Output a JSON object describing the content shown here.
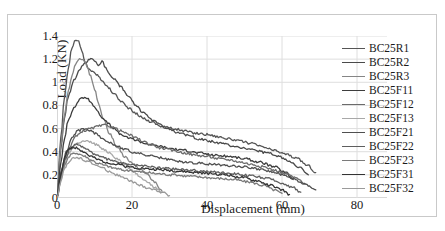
{
  "chart_data": {
    "type": "line",
    "title": "",
    "xlabel": "Displacement (mm)",
    "ylabel": "Load (KN)",
    "xlim": [
      0,
      88
    ],
    "ylim": [
      0,
      1.4
    ],
    "xticks": [
      0,
      20,
      40,
      60,
      80
    ],
    "yticks": [
      "0",
      "0.2",
      "0.4",
      "0.6",
      "0.8",
      "1",
      "1.2",
      "1.4"
    ],
    "grid": "both",
    "legend_position": "right",
    "series": [
      {
        "name": "BC25R1",
        "color": "#555555",
        "x": [
          0,
          1.0,
          2.0,
          3.0,
          4.0,
          5.0,
          5.8,
          6.6,
          7.5,
          8.5,
          9.5,
          10.5,
          12.0,
          13.5,
          15.0,
          17.0,
          19.0,
          21.0,
          23.0,
          25.0,
          28.0,
          31.0,
          34.0,
          37.0,
          40.0,
          43.0,
          46.0,
          49.0,
          52.0,
          55.0,
          58.0,
          61.0,
          64.0,
          67.0,
          69.0
        ],
        "y": [
          0,
          0.52,
          0.88,
          1.12,
          1.3,
          1.37,
          1.35,
          1.27,
          1.17,
          1.12,
          1.09,
          1.07,
          1.02,
          0.96,
          0.91,
          0.84,
          0.78,
          0.73,
          0.69,
          0.66,
          0.62,
          0.6,
          0.58,
          0.56,
          0.55,
          0.53,
          0.51,
          0.49,
          0.47,
          0.44,
          0.41,
          0.38,
          0.34,
          0.28,
          0.22
        ]
      },
      {
        "name": "BC25R2",
        "color": "#4a4a4a",
        "x": [
          0,
          1.0,
          2.0,
          3.0,
          4.5,
          6.0,
          7.5,
          9.0,
          10.0,
          11.0,
          12.0,
          13.0,
          14.0,
          15.5,
          17.0,
          19.0,
          21.0,
          23.0,
          26.0,
          29.0,
          32.0,
          35.0,
          38.0,
          41.0,
          44.0,
          47.0,
          50.0,
          53.0,
          56.0,
          59.0,
          62.0,
          65.0,
          67.0
        ],
        "y": [
          0,
          0.42,
          0.7,
          0.88,
          1.02,
          1.11,
          1.17,
          1.21,
          1.19,
          1.15,
          1.18,
          1.13,
          1.07,
          1.02,
          0.96,
          0.88,
          0.8,
          0.74,
          0.66,
          0.61,
          0.57,
          0.54,
          0.51,
          0.49,
          0.47,
          0.45,
          0.43,
          0.41,
          0.39,
          0.36,
          0.32,
          0.26,
          0.2
        ]
      },
      {
        "name": "BC25R3",
        "color": "#858585",
        "x": [
          0,
          1.0,
          2.0,
          3.0,
          4.0,
          5.0,
          6.0,
          7.0,
          8.0,
          9.0,
          10.0,
          11.0,
          12.5,
          14.0,
          16.0,
          18.0,
          20.0,
          22.0,
          24.0,
          26.0,
          28.0
        ],
        "y": [
          0,
          0.45,
          0.72,
          0.92,
          1.06,
          1.16,
          1.21,
          1.2,
          1.14,
          1.05,
          0.94,
          0.82,
          0.68,
          0.56,
          0.44,
          0.36,
          0.3,
          0.25,
          0.2,
          0.14,
          0.06
        ]
      },
      {
        "name": "BC25F11",
        "color": "#3d3d3d",
        "x": [
          0,
          1.0,
          2.0,
          3.0,
          4.5,
          6.0,
          7.0,
          8.0,
          9.0,
          10.0,
          11.0,
          12.0,
          13.5,
          15.0,
          17.0,
          19.0,
          21.0,
          24.0,
          27.0,
          30.0,
          34.0,
          38.0,
          42.0,
          46.0,
          50.0,
          54.0,
          58.0,
          61.0,
          63.0
        ],
        "y": [
          0,
          0.3,
          0.52,
          0.67,
          0.78,
          0.85,
          0.87,
          0.86,
          0.83,
          0.79,
          0.74,
          0.7,
          0.65,
          0.6,
          0.55,
          0.52,
          0.5,
          0.47,
          0.45,
          0.43,
          0.41,
          0.39,
          0.37,
          0.36,
          0.34,
          0.31,
          0.27,
          0.22,
          0.16
        ]
      },
      {
        "name": "BC25F12",
        "color": "#6b6b6b",
        "x": [
          0,
          1.5,
          3.0,
          5.0,
          7.0,
          9.0,
          11.0,
          13.0,
          15.0,
          17.0,
          19.0,
          21.0,
          23.0,
          25.0,
          28.0,
          31.0,
          34.0,
          37.0,
          40.0,
          43.0,
          46.0,
          49.0,
          52.0,
          55.0,
          58.0,
          61.0,
          64.0,
          66.0
        ],
        "y": [
          0,
          0.26,
          0.42,
          0.53,
          0.58,
          0.6,
          0.62,
          0.63,
          0.61,
          0.58,
          0.55,
          0.52,
          0.49,
          0.46,
          0.43,
          0.41,
          0.39,
          0.37,
          0.36,
          0.34,
          0.33,
          0.31,
          0.29,
          0.27,
          0.24,
          0.21,
          0.17,
          0.12
        ]
      },
      {
        "name": "BC25F13",
        "color": "#a8a8a8",
        "x": [
          0,
          1.5,
          3.0,
          4.5,
          6.0,
          7.5,
          9.0,
          10.5,
          12.0,
          14.0,
          16.0,
          18.0,
          20.0,
          22.0,
          24.0,
          26.0,
          28.0
        ],
        "y": [
          0,
          0.24,
          0.38,
          0.45,
          0.48,
          0.49,
          0.48,
          0.46,
          0.43,
          0.39,
          0.34,
          0.29,
          0.24,
          0.19,
          0.14,
          0.09,
          0.05
        ]
      },
      {
        "name": "BC25F21",
        "color": "#4f4f4f",
        "x": [
          0,
          1.0,
          2.5,
          4.0,
          5.5,
          7.0,
          8.5,
          10.0,
          12.0,
          14.0,
          16.0,
          18.0,
          21.0,
          24.0,
          27.0,
          30.0,
          34.0,
          38.0,
          42.0,
          46.0,
          50.0,
          54.0,
          58.0,
          62.0,
          66.0,
          69.0
        ],
        "y": [
          0,
          0.22,
          0.4,
          0.52,
          0.58,
          0.6,
          0.59,
          0.56,
          0.52,
          0.48,
          0.45,
          0.42,
          0.39,
          0.37,
          0.35,
          0.33,
          0.31,
          0.3,
          0.29,
          0.28,
          0.27,
          0.25,
          0.22,
          0.18,
          0.12,
          0.07
        ]
      },
      {
        "name": "BC25F22",
        "color": "#5e5e5e",
        "x": [
          0,
          1.0,
          2.0,
          3.5,
          5.0,
          6.5,
          8.0,
          10.0,
          12.0,
          14.0,
          16.0,
          19.0,
          22.0,
          25.0,
          28.0,
          32.0,
          36.0,
          40.0,
          44.0,
          48.0,
          52.0,
          56.0,
          60.0,
          63.0,
          65.0
        ],
        "y": [
          0,
          0.18,
          0.32,
          0.42,
          0.46,
          0.45,
          0.42,
          0.38,
          0.35,
          0.33,
          0.31,
          0.29,
          0.28,
          0.27,
          0.26,
          0.25,
          0.24,
          0.23,
          0.22,
          0.21,
          0.19,
          0.17,
          0.13,
          0.09,
          0.05
        ]
      },
      {
        "name": "BC25F23",
        "color": "#7a7a7a",
        "x": [
          0,
          1.0,
          2.0,
          3.0,
          4.0,
          5.0,
          6.0,
          7.5,
          9.0,
          11.0,
          13.0,
          15.0,
          18.0,
          21.0,
          24.0,
          27.0,
          31.0,
          35.0,
          39.0,
          43.0,
          47.0,
          51.0,
          55.0,
          58.0,
          60.0
        ],
        "y": [
          0,
          0.16,
          0.28,
          0.35,
          0.38,
          0.39,
          0.38,
          0.36,
          0.33,
          0.3,
          0.28,
          0.26,
          0.24,
          0.23,
          0.22,
          0.21,
          0.2,
          0.19,
          0.18,
          0.17,
          0.16,
          0.14,
          0.11,
          0.07,
          0.04
        ]
      },
      {
        "name": "BC25F31",
        "color": "#333333",
        "x": [
          0,
          1.0,
          2.0,
          3.0,
          4.0,
          5.5,
          7.0,
          9.0,
          11.0,
          13.0,
          16.0,
          19.0,
          22.0,
          25.0,
          29.0,
          33.0,
          37.0,
          41.0,
          45.0,
          49.0,
          53.0,
          57.0,
          60.0,
          62.0
        ],
        "y": [
          0,
          0.2,
          0.34,
          0.42,
          0.44,
          0.43,
          0.4,
          0.36,
          0.33,
          0.31,
          0.29,
          0.27,
          0.26,
          0.25,
          0.24,
          0.23,
          0.22,
          0.21,
          0.2,
          0.18,
          0.15,
          0.11,
          0.07,
          0.03
        ]
      },
      {
        "name": "BC25F32",
        "color": "#9a9a9a",
        "x": [
          0,
          1.0,
          2.0,
          3.0,
          4.0,
          5.0,
          6.5,
          8.0,
          10.0,
          12.0,
          14.0,
          16.0,
          18.0,
          20.0,
          22.0,
          24.0,
          26.0,
          28.0,
          30.0
        ],
        "y": [
          0,
          0.14,
          0.25,
          0.31,
          0.34,
          0.35,
          0.34,
          0.32,
          0.29,
          0.26,
          0.23,
          0.2,
          0.17,
          0.14,
          0.11,
          0.09,
          0.07,
          0.05,
          0.02
        ]
      }
    ]
  }
}
